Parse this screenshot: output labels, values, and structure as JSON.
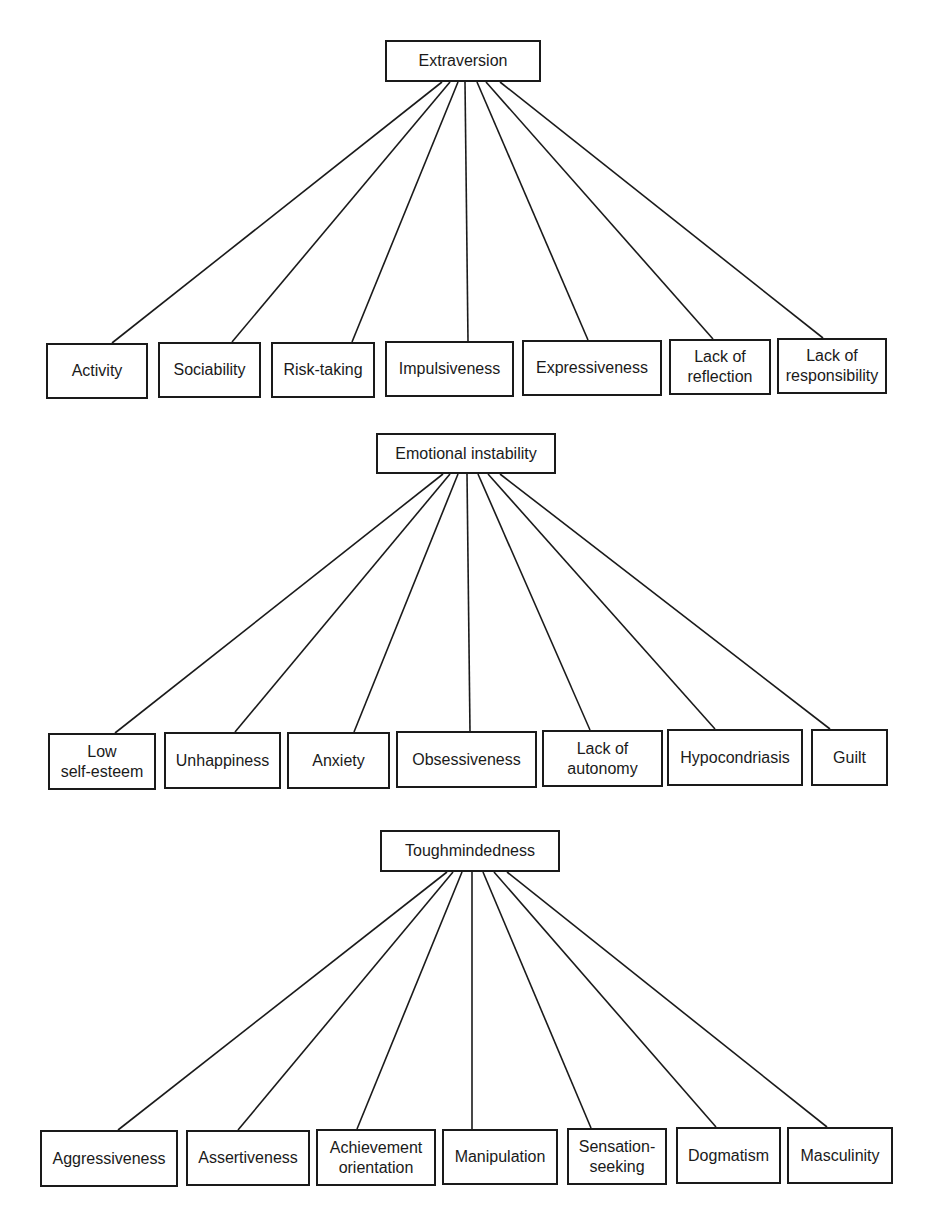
{
  "diagram": {
    "line_color": "#1a1a1a",
    "sections": [
      {
        "id": "extraversion",
        "parent": {
          "label": "Extraversion",
          "x": 385,
          "y": 40,
          "w": 156,
          "h": 42
        },
        "origin_y": 82,
        "children": [
          {
            "label": "Activity",
            "x": 46,
            "y": 343,
            "w": 102,
            "h": 56,
            "ox": 442,
            "ex": 112,
            "ey": 343
          },
          {
            "label": "Sociability",
            "x": 158,
            "y": 342,
            "w": 103,
            "h": 56,
            "ox": 450,
            "ex": 232,
            "ey": 342
          },
          {
            "label": "Risk-taking",
            "x": 271,
            "y": 342,
            "w": 104,
            "h": 56,
            "ox": 458,
            "ex": 352,
            "ey": 342
          },
          {
            "label": "Impulsiveness",
            "x": 385,
            "y": 341,
            "w": 129,
            "h": 56,
            "ox": 465,
            "ex": 468,
            "ey": 341
          },
          {
            "label": "Expressiveness",
            "x": 522,
            "y": 340,
            "w": 140,
            "h": 56,
            "ox": 477,
            "ex": 588,
            "ey": 340
          },
          {
            "label": "Lack of\nreflection",
            "x": 669,
            "y": 339,
            "w": 102,
            "h": 56,
            "ox": 486,
            "ex": 713,
            "ey": 339
          },
          {
            "label": "Lack of\nresponsibility",
            "x": 777,
            "y": 338,
            "w": 110,
            "h": 56,
            "ox": 500,
            "ex": 823,
            "ey": 338
          }
        ]
      },
      {
        "id": "emotional-instability",
        "parent": {
          "label": "Emotional instability",
          "x": 376,
          "y": 433,
          "w": 180,
          "h": 41
        },
        "origin_y": 474,
        "children": [
          {
            "label": "Low\nself-esteem",
            "x": 48,
            "y": 733,
            "w": 108,
            "h": 57,
            "ox": 443,
            "ex": 115,
            "ey": 733
          },
          {
            "label": "Unhappiness",
            "x": 164,
            "y": 732,
            "w": 117,
            "h": 57,
            "ox": 450,
            "ex": 235,
            "ey": 732
          },
          {
            "label": "Anxiety",
            "x": 287,
            "y": 732,
            "w": 103,
            "h": 57,
            "ox": 458,
            "ex": 354,
            "ey": 732
          },
          {
            "label": "Obsessiveness",
            "x": 396,
            "y": 731,
            "w": 141,
            "h": 57,
            "ox": 467,
            "ex": 470,
            "ey": 731
          },
          {
            "label": "Lack of\nautonomy",
            "x": 542,
            "y": 730,
            "w": 121,
            "h": 57,
            "ox": 478,
            "ex": 590,
            "ey": 730
          },
          {
            "label": "Hypocondriasis",
            "x": 667,
            "y": 729,
            "w": 136,
            "h": 57,
            "ox": 488,
            "ex": 715,
            "ey": 729
          },
          {
            "label": "Guilt",
            "x": 811,
            "y": 729,
            "w": 77,
            "h": 57,
            "ox": 500,
            "ex": 830,
            "ey": 729
          }
        ]
      },
      {
        "id": "toughmindedness",
        "parent": {
          "label": "Toughmindedness",
          "x": 380,
          "y": 830,
          "w": 180,
          "h": 42
        },
        "origin_y": 872,
        "children": [
          {
            "label": "Aggressiveness",
            "x": 40,
            "y": 1130,
            "w": 138,
            "h": 57,
            "ox": 447,
            "ex": 118,
            "ey": 1130
          },
          {
            "label": "Assertiveness",
            "x": 186,
            "y": 1130,
            "w": 124,
            "h": 56,
            "ox": 453,
            "ex": 238,
            "ey": 1130
          },
          {
            "label": "Achievement\norientation",
            "x": 316,
            "y": 1129,
            "w": 120,
            "h": 57,
            "ox": 462,
            "ex": 357,
            "ey": 1129
          },
          {
            "label": "Manipulation",
            "x": 442,
            "y": 1129,
            "w": 116,
            "h": 56,
            "ox": 472,
            "ex": 472,
            "ey": 1129
          },
          {
            "label": "Sensation-\nseeking",
            "x": 567,
            "y": 1128,
            "w": 100,
            "h": 57,
            "ox": 483,
            "ex": 591,
            "ey": 1128
          },
          {
            "label": "Dogmatism",
            "x": 676,
            "y": 1127,
            "w": 105,
            "h": 57,
            "ox": 494,
            "ex": 716,
            "ey": 1127
          },
          {
            "label": "Masculinity",
            "x": 787,
            "y": 1127,
            "w": 106,
            "h": 57,
            "ox": 507,
            "ex": 827,
            "ey": 1127
          }
        ]
      }
    ]
  }
}
